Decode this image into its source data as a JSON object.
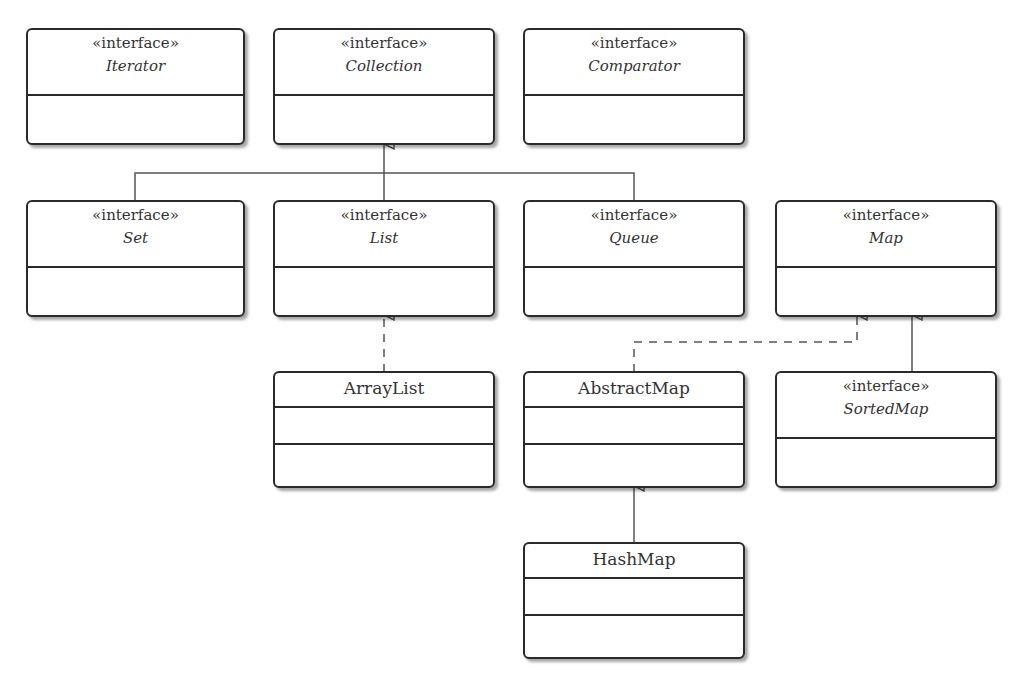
{
  "diagram": {
    "type": "UML class diagram",
    "stereotype": "«interface»",
    "nodes": [
      {
        "id": "iterator",
        "name": "Iterator",
        "kind": "interface"
      },
      {
        "id": "collection",
        "name": "Collection",
        "kind": "interface"
      },
      {
        "id": "comparator",
        "name": "Comparator",
        "kind": "interface"
      },
      {
        "id": "set",
        "name": "Set",
        "kind": "interface"
      },
      {
        "id": "list",
        "name": "List",
        "kind": "interface"
      },
      {
        "id": "queue",
        "name": "Queue",
        "kind": "interface"
      },
      {
        "id": "map",
        "name": "Map",
        "kind": "interface"
      },
      {
        "id": "arraylist",
        "name": "ArrayList",
        "kind": "class"
      },
      {
        "id": "abstractmap",
        "name": "AbstractMap",
        "kind": "class"
      },
      {
        "id": "sortedmap",
        "name": "SortedMap",
        "kind": "interface"
      },
      {
        "id": "hashmap",
        "name": "HashMap",
        "kind": "class"
      }
    ],
    "edges": [
      {
        "from": "Set",
        "to": "Collection",
        "type": "generalization"
      },
      {
        "from": "List",
        "to": "Collection",
        "type": "generalization"
      },
      {
        "from": "Queue",
        "to": "Collection",
        "type": "generalization"
      },
      {
        "from": "ArrayList",
        "to": "List",
        "type": "realization"
      },
      {
        "from": "AbstractMap",
        "to": "Map",
        "type": "realization"
      },
      {
        "from": "SortedMap",
        "to": "Map",
        "type": "generalization"
      },
      {
        "from": "HashMap",
        "to": "AbstractMap",
        "type": "generalization"
      }
    ]
  },
  "colors": {
    "line": "#2a2a2a",
    "connector": "#555555",
    "text": "#333333"
  }
}
